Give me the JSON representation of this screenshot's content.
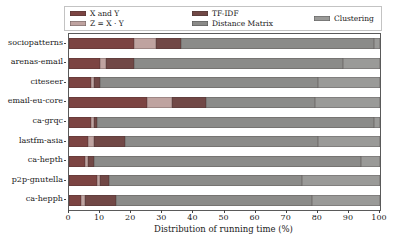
{
  "chart_data": {
    "type": "bar",
    "orientation": "horizontal",
    "stacked": true,
    "title": "",
    "xlabel": "Distribution of running time (%)",
    "ylabel": "",
    "xlim": [
      0,
      100
    ],
    "xticks": [
      0,
      10,
      20,
      30,
      40,
      50,
      60,
      70,
      80,
      90,
      100
    ],
    "grid": false,
    "legend_position": "top",
    "categories": [
      "sociopatterns",
      "arenas-email",
      "citeseer",
      "email-eu-core",
      "ca-grqc",
      "lastfm-asia",
      "ca-hepth",
      "p2p-gnutella",
      "ca-hepph"
    ],
    "series": [
      {
        "name": "X and Y",
        "color": "#7c4442",
        "hatch": "horizontal",
        "values": [
          21,
          10,
          7,
          25,
          7,
          6,
          5,
          9,
          4
        ]
      },
      {
        "name": "Z = X · Y",
        "color": "#bfa3a0",
        "hatch": "cross-dark",
        "values": [
          7,
          2,
          1,
          8,
          1,
          2,
          1,
          1,
          1
        ]
      },
      {
        "name": "TF-IDF",
        "color": "#714846",
        "hatch": "diagonal",
        "values": [
          8,
          9,
          2,
          11,
          1,
          10,
          2,
          3,
          10
        ]
      },
      {
        "name": "Distance Matrix",
        "color": "#8b8b89",
        "hatch": "none",
        "values": [
          62,
          67,
          70,
          35,
          89,
          62,
          86,
          62,
          63
        ]
      },
      {
        "name": "Clustering",
        "color": "#9a9a98",
        "hatch": "cross-light",
        "values": [
          2,
          12,
          20,
          21,
          2,
          20,
          6,
          25,
          22
        ]
      }
    ]
  }
}
